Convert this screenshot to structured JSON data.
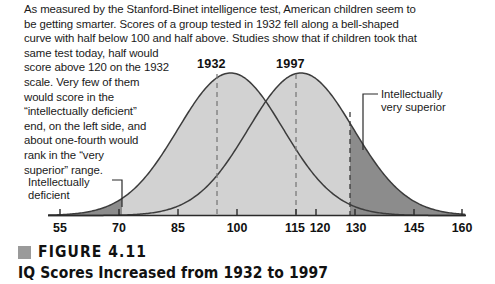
{
  "body_text": {
    "lines": [
      "As measured by the Stanford-Binet intelligence test, American children seem to",
      "be getting smarter. Scores of a group tested in 1932 fell along a bell-shaped",
      "curve with half below 100 and half above. Studies show that if children took that",
      "same test today, half would"
    ],
    "narrow_lines": [
      "score above 120 on the 1932",
      "scale. Very few of them",
      "would score in the",
      "“intellectually deficient”",
      "end, on the left side, and",
      "about one-fourth would",
      "rank in the “very",
      "superior” range."
    ]
  },
  "peak_labels": {
    "curve1": "1932",
    "curve2": "1997"
  },
  "annotations": {
    "deficient": [
      "Intellectually",
      "deficient"
    ],
    "superior": [
      "Intellectually",
      "very superior"
    ]
  },
  "caption": {
    "figure_number": "FIGURE 4.11",
    "title": "IQ Scores Increased from 1932 to 1997"
  },
  "colors": {
    "curve_fill_light": "#d2d2d2",
    "curve_fill_dark": "#8c8c8c",
    "curve_stroke": "#3c3c3c",
    "axis": "#2a2a2a",
    "dashed": "#808080",
    "text": "#1a1a1a",
    "caption_swatch": "#9a9a9a"
  },
  "chart_data": {
    "type": "area",
    "title": "IQ Scores Increased from 1932 to 1997",
    "xlabel": "IQ score (1932 scale)",
    "ylabel": "Relative frequency",
    "xlim": [
      48,
      167
    ],
    "ylim": [
      0,
      1
    ],
    "grid": false,
    "legend_position": "inline-peak-labels",
    "tick_labels": [
      "55",
      "70",
      "85",
      "100",
      "115",
      "120",
      "130",
      "145",
      "160"
    ],
    "tick_values": [
      55,
      70,
      85,
      100,
      115,
      120,
      130,
      145,
      160
    ],
    "series": [
      {
        "name": "1932",
        "mean": 100,
        "sd": 15,
        "peak_label": "1932",
        "fill": "#d2d2d2",
        "marker_line": 100
      },
      {
        "name": "1997",
        "mean": 120,
        "sd": 15,
        "peak_label": "1997",
        "fill": "#d2d2d2",
        "marker_line": 120
      }
    ],
    "shaded_regions": [
      {
        "label": "Intellectually deficient",
        "series": "1932",
        "range": [
          48,
          70
        ],
        "fill": "#8c8c8c"
      },
      {
        "label": "Intellectually very superior",
        "series": "1997",
        "range": [
          130,
          167
        ],
        "fill": "#8c8c8c"
      }
    ],
    "annotations": [
      {
        "text": "Intellectually deficient",
        "points_to": 70
      },
      {
        "text": "Intellectually very superior",
        "points_to": 130
      },
      {
        "text": "1932",
        "points_to": 100
      },
      {
        "text": "1997",
        "points_to": 120
      }
    ]
  }
}
